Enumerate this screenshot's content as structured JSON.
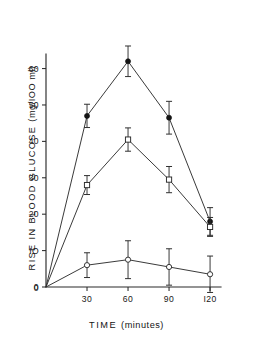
{
  "chart_data": {
    "type": "line",
    "title": "",
    "xlabel": "TIME  (minutes)",
    "xlabel_main": "TIME",
    "xlabel_unit": "(minutes)",
    "ylabel": "RISE IN BLOOD GLUCOSE  (mg/100 ml)",
    "ylabel_main": "RISE  IN  BLOOD  GLUCOSE",
    "ylabel_unit": "(mg/IOO ml)",
    "x": [
      0,
      30,
      60,
      90,
      120
    ],
    "xlim": [
      0,
      128
    ],
    "ylim": [
      0,
      64
    ],
    "grid": false,
    "legend": "none",
    "xticks": [
      0,
      30,
      60,
      90,
      120
    ],
    "xtick_labels": [
      "0",
      "30",
      "60",
      "90",
      "I20"
    ],
    "yticks": [
      0,
      10,
      20,
      30,
      40,
      50,
      60
    ],
    "ytick_labels": [
      "0",
      "IO",
      "20",
      "30",
      "40",
      "50",
      "60"
    ],
    "series": [
      {
        "name": "series-filled-circle",
        "marker": "filled-circle",
        "values": [
          0,
          47,
          62,
          46.5,
          18
        ],
        "errors": [
          0,
          3.2,
          4.2,
          4.5,
          3.8
        ]
      },
      {
        "name": "series-open-square",
        "marker": "open-square",
        "values": [
          0,
          28,
          40.5,
          29.5,
          16.5
        ],
        "errors": [
          0,
          2.6,
          3.2,
          3.6,
          2.6
        ]
      },
      {
        "name": "series-open-circle",
        "marker": "open-circle",
        "values": [
          0,
          6,
          7.5,
          5.5,
          3.5
        ],
        "errors": [
          0,
          3.4,
          5.2,
          5.0,
          5.0
        ]
      }
    ]
  },
  "colors": {
    "axis": "#2b2b2b",
    "line": "#2f2f2f",
    "marker_fill": "#141414",
    "marker_open": "#ffffff",
    "background": "#ffffff"
  }
}
